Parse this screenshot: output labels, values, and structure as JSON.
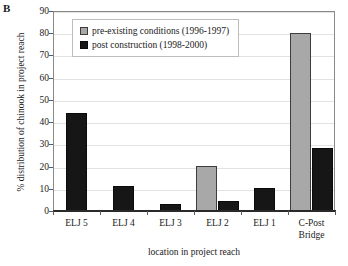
{
  "figure": {
    "panel_label": "B"
  },
  "chart_data": {
    "type": "bar",
    "title": "",
    "xlabel": "location in project reach",
    "ylabel": "% distribution of chinook in project reach",
    "categories": [
      "ELJ 5",
      "ELJ 4",
      "ELJ 3",
      "ELJ 2",
      "ELJ 1",
      "C-Post Bridge"
    ],
    "category_labels_multiline": [
      "ELJ 5",
      "ELJ 4",
      "ELJ 3",
      "ELJ 2",
      "ELJ 1",
      "C-Post\nBridge"
    ],
    "series": [
      {
        "name": "pre-existing conditions (1996-1997)",
        "color": "#a8a8a8",
        "values": [
          0,
          0,
          0,
          20.3,
          0,
          80.3
        ]
      },
      {
        "name": "post construction (1998-2000)",
        "color": "#161616",
        "values": [
          44.2,
          11.1,
          3.3,
          4.4,
          10.2,
          28.2
        ]
      }
    ],
    "ylim": [
      0,
      90
    ],
    "yticks": [
      0,
      10,
      20,
      30,
      40,
      50,
      60,
      70,
      80,
      90
    ],
    "ytick_labels": [
      "0",
      "10",
      "20",
      "30",
      "40",
      "50",
      "60",
      "70",
      "80",
      "90"
    ],
    "grid": true,
    "legend_position": "upper-left-inside"
  }
}
